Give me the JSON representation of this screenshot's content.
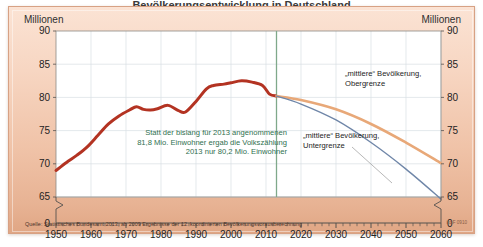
{
  "title_partial": "Bevölkerungsentwicklung in Deutschland",
  "unit_label_left": "Millionen",
  "unit_label_right": "Millionen",
  "source_note": "Quelle: Statistisches Bundesamt 2013, ab 2009 Ergebnisse der 12. koordinierten Bevölkerungsvorausberechnung",
  "publisher_code": "i.d.F 0910",
  "colors": {
    "historical": "#b33322",
    "upper_projection": "#e8a878",
    "lower_projection": "#6f86a8",
    "divider": "#7fa98a",
    "annotation_text": "#2f6f4f",
    "panel_light": "#fbe3d4",
    "panel_dark": "#e0a684",
    "plot_bg": "#ffffff",
    "grid": "#d9dfe4",
    "axis": "#55524f"
  },
  "annotation": {
    "line1": "Statt der bislang für 2013 angenommenen",
    "line2": "81,8 Mio. Einwohner ergab die Volkszählung",
    "line3": "2013 nur 80,2 Mio. Einwohner"
  },
  "legend": {
    "upper": {
      "line1": "„mittlere“ Bevölkerung,",
      "line2": "Obergrenze"
    },
    "lower": {
      "line1": "„mittlere“ Bevölkerung,",
      "line2": "Untergrenze"
    }
  },
  "chart_data": {
    "type": "line",
    "title": "Bevölkerungsentwicklung in Deutschland",
    "xlabel": "",
    "ylabel": "Millionen",
    "xlim": [
      1950,
      2060
    ],
    "ylim": [
      63.5,
      90
    ],
    "ylim_display_break_at": 65,
    "grid": true,
    "legend_position": "inline-right",
    "yticks": [
      65,
      70,
      75,
      80,
      85,
      90
    ],
    "ytick_zero_label": "0",
    "xticks": [
      1950,
      1960,
      1970,
      1980,
      1990,
      2000,
      2010,
      2020,
      2030,
      2040,
      2050,
      2060
    ],
    "xtick_minor_step": 2,
    "projection_start_year": 2013,
    "series": [
      {
        "name": "Bevölkerung (tatsächlich)",
        "color": "#b33322",
        "x": [
          1950,
          1953,
          1956,
          1959,
          1962,
          1965,
          1968,
          1971,
          1973,
          1975,
          1977,
          1979,
          1982,
          1985,
          1987,
          1990,
          1993,
          1995,
          1998,
          2000,
          2003,
          2006,
          2009,
          2011,
          2013
        ],
        "values": [
          69.0,
          70.2,
          71.3,
          72.6,
          74.3,
          76.0,
          77.2,
          78.1,
          78.6,
          78.2,
          78.1,
          78.3,
          78.8,
          78.0,
          77.8,
          79.4,
          81.3,
          81.8,
          82.0,
          82.2,
          82.5,
          82.3,
          81.8,
          80.5,
          80.2
        ]
      },
      {
        "name": "„mittlere“ Bevölkerung, Obergrenze",
        "color": "#e8a878",
        "x": [
          2013,
          2020,
          2030,
          2040,
          2050,
          2060
        ],
        "values": [
          80.2,
          79.6,
          78.2,
          76.0,
          73.2,
          70.1
        ]
      },
      {
        "name": "„mittlere“ Bevölkerung, Untergrenze",
        "color": "#6f86a8",
        "x": [
          2013,
          2020,
          2030,
          2040,
          2050,
          2060
        ],
        "values": [
          80.2,
          79.0,
          76.6,
          73.2,
          69.2,
          64.7
        ]
      }
    ],
    "annotations": [
      {
        "text": "Statt der bislang für 2013 angenommenen 81,8 Mio. Einwohner ergab die Volkszählung 2013 nur 80,2 Mio. Einwohner",
        "color": "#2f6f4f"
      }
    ]
  }
}
